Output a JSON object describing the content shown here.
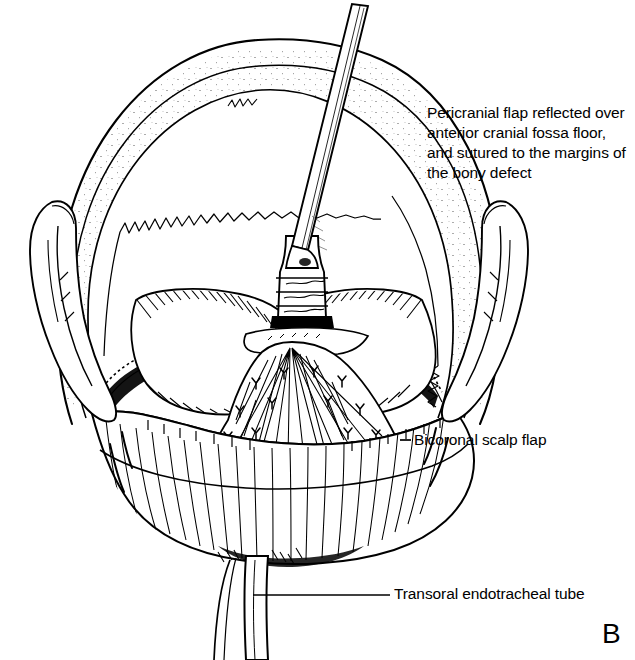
{
  "figure": {
    "panel_letter": "B",
    "background_color": "#ffffff",
    "ink_color": "#000000",
    "view": "anterior craniofacial exposure, superior-anterior view"
  },
  "callouts": [
    {
      "id": "pericranial-flap",
      "text": "Pericranial flap reflected over anterior cranial fossa floor, and sutured to the margins of the bony defect",
      "lines": [
        "Pericranial flap reflected",
        "over anterior cranial fossa",
        "floor, and sutured to the",
        "margins of the bony",
        "defect"
      ],
      "leader": false
    },
    {
      "id": "bicoronal-scalp-flap",
      "text": "Bicoronal scalp flap",
      "lines": [
        "Bicoronal scalp flap"
      ],
      "leader": true,
      "leader_from": [
        408,
        440
      ],
      "leader_to": [
        411,
        440
      ]
    },
    {
      "id": "transoral-endotracheal-tube",
      "text": "Transoral endotracheal tube",
      "lines": [
        "Transoral endotracheal tube"
      ],
      "leader": true,
      "leader_from": [
        253,
        595
      ],
      "leader_to": [
        390,
        595
      ]
    }
  ],
  "anatomy_labels": {
    "cranium": "cranial vault",
    "scalp": "bicoronal scalp flap reflected anteriorly",
    "fossa_floor": "anterior cranial fossa floor",
    "orbital_roofs": "orbital roofs",
    "pericranium": "pericranial flap",
    "retractor": "retractor instrument",
    "ears": "auricles",
    "tube": "transoral endotracheal tube"
  }
}
